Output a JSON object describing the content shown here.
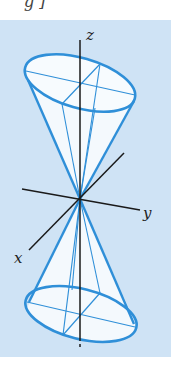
{
  "caption_fragment": "g  ]",
  "figure": {
    "type": "double-cone diagram",
    "axes": {
      "x_label": "x",
      "y_label": "y",
      "z_label": "z"
    },
    "colors": {
      "background": "#cfe3f5",
      "cone_outline": "#2f8fd8",
      "cone_fill": "#f4f9fd",
      "axis": "#1a1a1a"
    }
  }
}
